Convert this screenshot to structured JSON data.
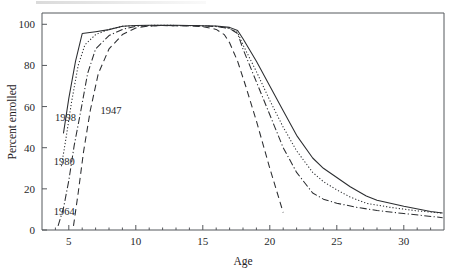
{
  "figure": {
    "background": "#ffffff",
    "ink_color": "#2b2d30"
  },
  "chart_data": {
    "type": "line",
    "title": "",
    "xlabel": "Age",
    "ylabel": "Percent enrolled",
    "xlim": [
      3,
      33
    ],
    "ylim": [
      0,
      105
    ],
    "grid": false,
    "legend_position": "inline-annotations",
    "xticks": [
      5,
      10,
      15,
      20,
      25,
      30
    ],
    "xticklabels": [
      "5",
      "10",
      "15",
      "20",
      "25",
      "30"
    ],
    "xminorticks": [
      4,
      6,
      7,
      8,
      9,
      11,
      12,
      13,
      14,
      16,
      17,
      18,
      19,
      21,
      22,
      23,
      24,
      26,
      27,
      28,
      29,
      31,
      32
    ],
    "yticks": [
      0,
      20,
      40,
      60,
      80,
      100
    ],
    "yticklabels": [
      "0",
      "20",
      "40",
      "60",
      "80",
      "100"
    ],
    "series": [
      {
        "name": "1998",
        "linestyle": "solid",
        "dasharray": "none",
        "label": "1998",
        "label_x": 4.05,
        "label_y": 55.0,
        "x": [
          4.6,
          5.0,
          5.5,
          6.0,
          7.0,
          8.0,
          9.0,
          10.0,
          11.0,
          12.0,
          13.0,
          14.0,
          15.0,
          16.0,
          17.0,
          17.6,
          18.0,
          19.0,
          20.0,
          21.0,
          22.0,
          23.2,
          24.0,
          25.0,
          26.0,
          27.2,
          28.0,
          30.0,
          32.0,
          32.9
        ],
        "y": [
          47.0,
          64.0,
          82.0,
          95.5,
          96.4,
          97.4,
          99.0,
          99.4,
          99.5,
          99.5,
          99.5,
          99.4,
          99.3,
          99.2,
          98.5,
          97.0,
          93.0,
          82.0,
          70.0,
          58.0,
          46.0,
          35.0,
          30.0,
          25.5,
          21.0,
          16.5,
          14.5,
          11.5,
          9.0,
          8.3
        ]
      },
      {
        "name": "1980",
        "linestyle": "dotted",
        "dasharray": "1.2 2.0",
        "label": "1980",
        "label_x": 3.95,
        "label_y": 33.5,
        "x": [
          4.45,
          4.8,
          5.2,
          5.7,
          6.2,
          7.0,
          8.0,
          9.0,
          10.0,
          12.0,
          14.0,
          15.0,
          16.0,
          17.0,
          17.6,
          18.0,
          19.0,
          20.0,
          21.0,
          22.0,
          23.2,
          24.0,
          25.0,
          26.0,
          27.2,
          29.0,
          31.0,
          32.9
        ],
        "y": [
          31.0,
          45.0,
          62.0,
          80.0,
          90.0,
          95.0,
          97.5,
          99.0,
          99.4,
          99.5,
          99.4,
          99.2,
          99.0,
          98.0,
          96.0,
          90.0,
          77.0,
          63.0,
          50.0,
          38.5,
          28.0,
          23.5,
          19.5,
          16.0,
          13.0,
          11.0,
          9.3,
          8.2
        ]
      },
      {
        "name": "1964",
        "linestyle": "dashdot",
        "dasharray": "7 2.4 1.2 2.4",
        "label": "1964",
        "label_x": 3.95,
        "label_y": 9.0,
        "x": [
          4.2,
          4.6,
          5.0,
          5.4,
          5.9,
          6.4,
          7.0,
          8.0,
          9.0,
          10.0,
          12.0,
          14.0,
          15.0,
          16.0,
          17.0,
          17.6,
          18.0,
          19.0,
          20.0,
          21.0,
          22.0,
          23.2,
          24.0,
          25.0,
          26.5,
          28.0,
          30.0,
          32.9
        ],
        "y": [
          2.0,
          10.5,
          24.0,
          41.0,
          58.0,
          76.0,
          88.0,
          94.5,
          97.5,
          99.0,
          99.4,
          99.3,
          99.2,
          98.9,
          98.0,
          95.5,
          88.0,
          72.0,
          56.0,
          40.0,
          28.0,
          18.0,
          15.0,
          13.0,
          11.0,
          9.5,
          8.0,
          6.0
        ]
      },
      {
        "name": "1947",
        "linestyle": "dashed",
        "dasharray": "6.5 4",
        "label": "1947",
        "label_x": 7.0,
        "label_y": 58.5,
        "x": [
          5.35,
          5.7,
          6.1,
          6.6,
          7.2,
          8.0,
          9.0,
          10.0,
          11.0,
          12.0,
          13.0,
          14.0,
          15.0,
          16.0,
          16.6,
          17.0,
          17.6,
          18.2,
          19.0,
          20.0,
          21.0
        ],
        "y": [
          2.0,
          18.0,
          38.0,
          58.0,
          76.0,
          88.0,
          95.0,
          98.2,
          99.2,
          99.4,
          99.3,
          99.2,
          98.9,
          97.5,
          95.0,
          91.0,
          82.0,
          70.0,
          53.0,
          30.0,
          8.5
        ]
      }
    ]
  }
}
